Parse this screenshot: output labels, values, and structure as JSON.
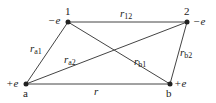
{
  "diagram": {
    "nodes": [
      {
        "id": "1",
        "label": "1",
        "charge": "−e",
        "x": 68,
        "y": 22
      },
      {
        "id": "2",
        "label": "2",
        "charge": "−e",
        "x": 187,
        "y": 22
      },
      {
        "id": "a",
        "label": "a",
        "charge": "+e",
        "x": 26,
        "y": 84
      },
      {
        "id": "b",
        "label": "b",
        "charge": "+e",
        "x": 170,
        "y": 84
      }
    ],
    "edges": [
      {
        "from": "1",
        "to": "2",
        "label": "r",
        "sub": "12"
      },
      {
        "from": "a",
        "to": "1",
        "label": "r",
        "sub": "a1"
      },
      {
        "from": "a",
        "to": "2",
        "label": "r",
        "sub": "a2"
      },
      {
        "from": "1",
        "to": "b",
        "label": "r",
        "sub": "b1"
      },
      {
        "from": "2",
        "to": "b",
        "label": "r",
        "sub": "b2"
      },
      {
        "from": "a",
        "to": "b",
        "label": "r",
        "sub": ""
      }
    ],
    "colors": {
      "line": "#333333",
      "node": "#222222"
    }
  }
}
